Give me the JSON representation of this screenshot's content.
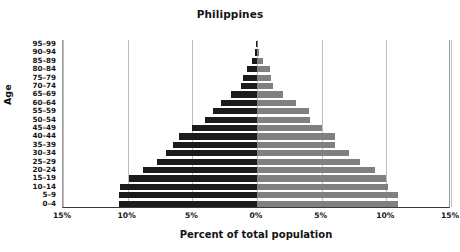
{
  "chart_data": {
    "type": "bar",
    "subtype": "population-pyramid",
    "title": "Philippines",
    "xlabel": "Percent of total population",
    "ylabel": "Age",
    "categories": [
      "0–4",
      "5–9",
      "10–14",
      "15–19",
      "20–24",
      "25–29",
      "30–34",
      "35–39",
      "40–44",
      "45–49",
      "50–54",
      "55–59",
      "60–64",
      "65–69",
      "70–74",
      "75–79",
      "80–84",
      "85–89",
      "90–94",
      "95–99"
    ],
    "series": [
      {
        "name": "Male",
        "side": "left",
        "color": "#1b1b1b",
        "values": [
          10.7,
          10.7,
          10.6,
          9.9,
          8.8,
          7.7,
          7.0,
          6.5,
          6.0,
          5.0,
          4.0,
          3.4,
          2.8,
          2.0,
          1.2,
          1.1,
          0.8,
          0.35,
          0.12,
          0.05
        ]
      },
      {
        "name": "Female",
        "side": "right",
        "color": "#808080",
        "values": [
          10.9,
          10.9,
          10.1,
          10.0,
          9.1,
          8.0,
          7.1,
          6.0,
          6.0,
          5.0,
          4.1,
          4.0,
          3.0,
          2.0,
          1.2,
          1.1,
          1.0,
          0.45,
          0.15,
          0.06
        ]
      }
    ],
    "xlim": [
      -15,
      15
    ],
    "xticks": [
      -15,
      -10,
      -5,
      0,
      5,
      10,
      15
    ],
    "xtick_labels": [
      "15%",
      "10%",
      "5%",
      "0%",
      "5%",
      "10%",
      "15%"
    ],
    "grid": true,
    "grid_axis": "x",
    "legend": "none",
    "background": "#ffffff",
    "axis_color": "#3a3a3a",
    "gridline_color": "#bdbdbd"
  }
}
